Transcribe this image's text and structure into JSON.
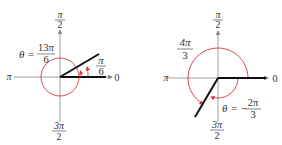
{
  "diagrams": [
    {
      "id": "left",
      "theta_label": "θ =",
      "theta_num": "13π",
      "theta_den": "6",
      "angle_num": "π",
      "angle_den": "6",
      "axis_top_num": "π",
      "axis_top_den": "2",
      "axis_left": "π",
      "axis_right": "0",
      "axis_bottom_num": "3π",
      "axis_bottom_den": "2"
    },
    {
      "id": "right",
      "theta_label": "θ = −",
      "theta_num": "2π",
      "theta_den": "3",
      "angle_num": "4π",
      "angle_den": "3",
      "axis_top_num": "π",
      "axis_top_den": "2",
      "axis_left": "π",
      "axis_right": "0",
      "axis_bottom_num": "3π",
      "axis_bottom_den": "2"
    }
  ],
  "colors": {
    "arc": "#d9363e",
    "axis": "#888888",
    "ray": "#111111"
  }
}
